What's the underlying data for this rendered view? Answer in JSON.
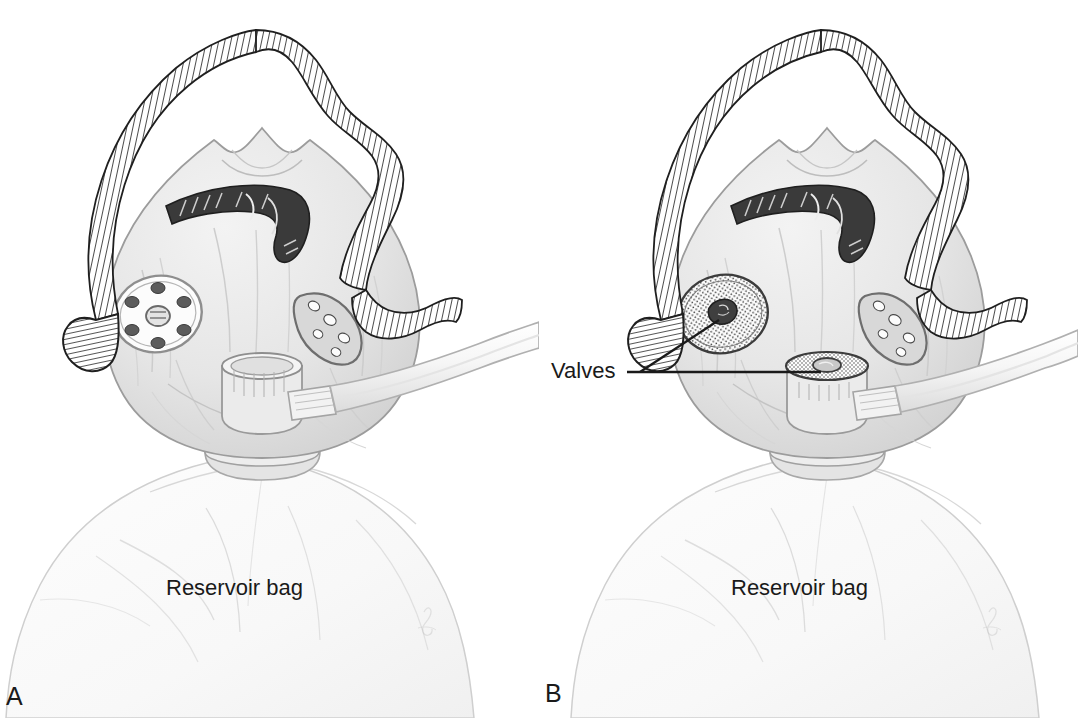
{
  "figure": {
    "background_color": "#ffffff",
    "ink_color": "#1a1a1a",
    "mask_fill": "#e9e9e9",
    "mask_stroke": "#9a9a9a",
    "bag_fill": "#fbfbfb",
    "bag_stroke": "#c9c9c9",
    "tube_fill": "#f4f4f4",
    "valve_fill": "#fdfdfd"
  },
  "panels": [
    {
      "id": "a",
      "letter": "A",
      "device_name": "partial-rebreather-mask",
      "bag_label": "Reservoir bag",
      "side_port_type": "perforated-open-port",
      "side_port_hole_count": 6,
      "has_valves": false,
      "valves_label": null
    },
    {
      "id": "b",
      "letter": "B",
      "device_name": "nonrebreather-mask",
      "bag_label": "Reservoir bag",
      "side_port_type": "stippled-one-way-valve",
      "side_port_hole_count": 1,
      "has_valves": true,
      "valves_label": "Valves",
      "valve_leader_targets": [
        "side-valve",
        "center-valve"
      ]
    }
  ]
}
